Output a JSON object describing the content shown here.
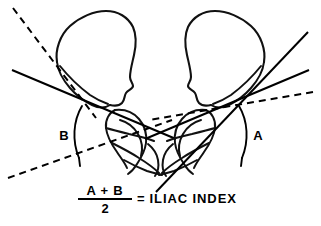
{
  "figure": {
    "background_color": "#ffffff",
    "ink_color": "#000000",
    "width": 321,
    "height": 226
  },
  "labels": {
    "angle_left": "B",
    "angle_right": "A"
  },
  "formula": {
    "numerator": "A + B",
    "denominator": "2",
    "equals": "=",
    "result": "ILIAC INDEX"
  },
  "annotations": {
    "left_bone_name": "left-iliac-wing",
    "right_bone_name": "right-iliac-wing",
    "left_acetabulum_name": "left-acetabulum",
    "right_acetabulum_name": "right-acetabulum"
  }
}
